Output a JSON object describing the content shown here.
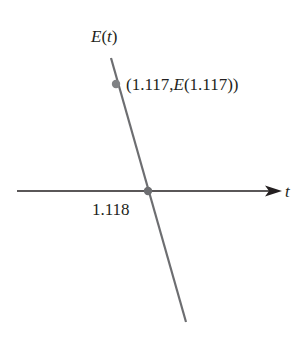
{
  "diagram": {
    "type": "tangent-line-root-approximation",
    "y_axis_label": {
      "func": "E",
      "var": "t"
    },
    "x_axis_label": "t",
    "point_label": {
      "open": "(1.117,",
      "func": "E",
      "arg": "(1.117))"
    },
    "root_label": "1.118",
    "colors": {
      "line": "#6d6e71",
      "axis": "#231f20",
      "point": "#808285",
      "text": "#231f20"
    }
  }
}
